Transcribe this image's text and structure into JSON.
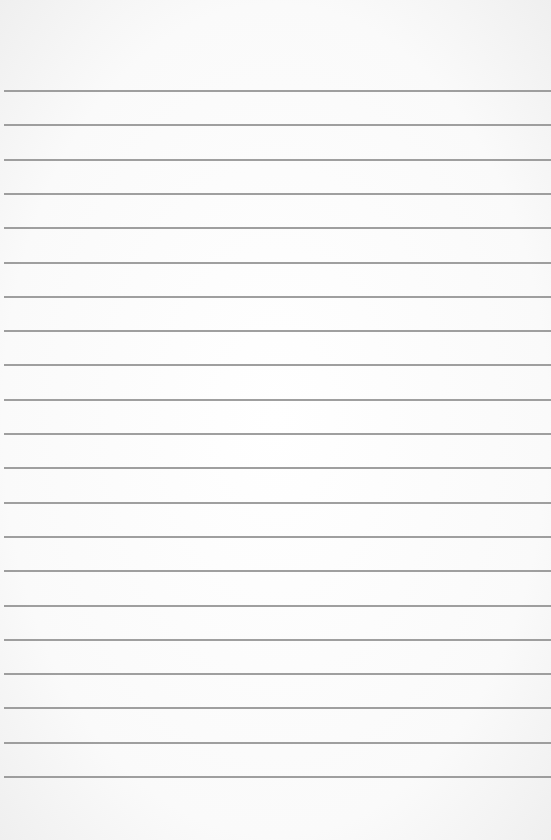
{
  "paper": {
    "type": "lined-paper",
    "background_color": "#ffffff",
    "line_color": "#8e8e8e",
    "line_count": 21,
    "first_line_y": 90,
    "line_spacing": 34.3
  }
}
